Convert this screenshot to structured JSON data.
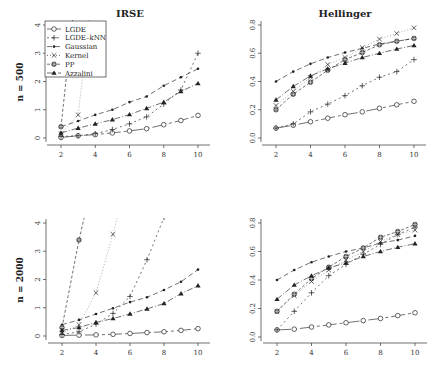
{
  "figure": {
    "column_titles": [
      "IRSE",
      "Hellinger"
    ],
    "row_labels": [
      "n = 500",
      "n = 2000"
    ]
  },
  "legend": {
    "entries": [
      {
        "name": "LGDE",
        "marker": "circle-open",
        "dash": "14,3,3,3"
      },
      {
        "name": "LGDE–kNN",
        "marker": "plus",
        "dash": "2,3"
      },
      {
        "name": "Gaussian",
        "marker": "dot",
        "dash": "5,3"
      },
      {
        "name": "Kernel",
        "marker": "cross",
        "dash": "1,2"
      },
      {
        "name": "PP",
        "marker": "circle-cross",
        "dash": "3,2"
      },
      {
        "name": "Azzalini",
        "marker": "triangle",
        "dash": "6,2,1,2"
      }
    ]
  },
  "chart_data": [
    {
      "type": "line",
      "title": "IRSE",
      "row_label": "n = 500",
      "xlabel": "",
      "ylabel": "n = 500",
      "x": [
        2,
        3,
        4,
        5,
        6,
        7,
        8,
        9,
        10
      ],
      "xlim": [
        2,
        10
      ],
      "ylim": [
        0,
        4
      ],
      "xticks": [
        2,
        4,
        6,
        8,
        10
      ],
      "yticks": [
        0,
        1,
        2,
        3,
        4
      ],
      "legend_position": "top-left",
      "series": [
        {
          "name": "LGDE",
          "values": [
            0.02,
            0.08,
            0.12,
            0.18,
            0.25,
            0.33,
            0.47,
            0.62,
            0.8
          ]
        },
        {
          "name": "LGDE–kNN",
          "values": [
            0.05,
            0.08,
            0.15,
            0.3,
            0.5,
            0.75,
            1.2,
            1.7,
            3.0
          ]
        },
        {
          "name": "Gaussian",
          "values": [
            0.4,
            0.6,
            0.82,
            1.0,
            1.27,
            1.47,
            1.85,
            2.15,
            2.45
          ]
        },
        {
          "name": "Kernel",
          "values": [
            0.15,
            0.82,
            6.0,
            null,
            null,
            null,
            null,
            null,
            null
          ]
        },
        {
          "name": "PP",
          "values": [
            0.4,
            6.0,
            null,
            null,
            null,
            null,
            null,
            null,
            null
          ]
        },
        {
          "name": "Azzalini",
          "values": [
            0.18,
            0.35,
            0.5,
            0.65,
            0.83,
            1.05,
            1.27,
            1.65,
            1.93
          ]
        }
      ]
    },
    {
      "type": "line",
      "title": "Hellinger",
      "row_label": "n = 500",
      "xlabel": "",
      "ylabel": "",
      "x": [
        2,
        3,
        4,
        5,
        6,
        7,
        8,
        9,
        10
      ],
      "xlim": [
        2,
        10
      ],
      "ylim": [
        0,
        0.8
      ],
      "xticks": [
        2,
        4,
        6,
        8,
        10
      ],
      "yticks": [
        0.0,
        0.2,
        0.4,
        0.6,
        0.8
      ],
      "series": [
        {
          "name": "LGDE",
          "values": [
            0.07,
            0.09,
            0.115,
            0.14,
            0.165,
            0.185,
            0.21,
            0.235,
            0.26
          ]
        },
        {
          "name": "LGDE–kNN",
          "values": [
            0.07,
            0.1,
            0.185,
            0.24,
            0.3,
            0.37,
            0.43,
            0.47,
            0.555
          ]
        },
        {
          "name": "Gaussian",
          "values": [
            0.4,
            0.47,
            0.525,
            0.57,
            0.605,
            0.635,
            0.665,
            0.685,
            0.705
          ]
        },
        {
          "name": "Kernel",
          "values": [
            0.23,
            0.33,
            0.43,
            0.52,
            0.57,
            0.64,
            0.7,
            0.74,
            0.78
          ]
        },
        {
          "name": "PP",
          "values": [
            0.2,
            0.31,
            0.395,
            0.48,
            0.555,
            0.605,
            0.66,
            0.685,
            0.705
          ]
        },
        {
          "name": "Azzalini",
          "values": [
            0.27,
            0.365,
            0.44,
            0.49,
            0.53,
            0.57,
            0.6,
            0.63,
            0.655
          ]
        }
      ]
    },
    {
      "type": "line",
      "title": "",
      "row_label": "n = 2000",
      "xlabel": "",
      "ylabel": "n = 2000",
      "x": [
        2,
        3,
        4,
        5,
        6,
        7,
        8,
        9,
        10
      ],
      "xlim": [
        2,
        10
      ],
      "ylim": [
        0,
        4
      ],
      "xticks": [
        2,
        4,
        6,
        8,
        10
      ],
      "yticks": [
        0,
        1,
        2,
        3,
        4
      ],
      "series": [
        {
          "name": "LGDE",
          "values": [
            0.02,
            0.03,
            0.04,
            0.06,
            0.09,
            0.12,
            0.15,
            0.2,
            0.26
          ]
        },
        {
          "name": "LGDE–kNN",
          "values": [
            0.05,
            0.15,
            0.42,
            0.8,
            1.4,
            2.7,
            4.2,
            null,
            null
          ]
        },
        {
          "name": "Gaussian",
          "values": [
            0.4,
            0.57,
            0.78,
            0.98,
            1.2,
            1.37,
            1.63,
            1.92,
            2.35
          ]
        },
        {
          "name": "Kernel",
          "values": [
            0.1,
            0.4,
            1.53,
            3.6,
            6.0,
            null,
            null,
            null,
            null
          ]
        },
        {
          "name": "PP",
          "values": [
            0.3,
            3.4,
            6.0,
            null,
            null,
            null,
            null,
            null,
            null
          ]
        },
        {
          "name": "Azzalini",
          "values": [
            0.2,
            0.3,
            0.48,
            0.62,
            0.78,
            0.96,
            1.15,
            1.5,
            1.78
          ]
        }
      ]
    },
    {
      "type": "line",
      "title": "",
      "row_label": "n = 2000",
      "xlabel": "",
      "ylabel": "",
      "x": [
        2,
        3,
        4,
        5,
        6,
        7,
        8,
        9,
        10
      ],
      "xlim": [
        2,
        10
      ],
      "ylim": [
        0,
        0.8
      ],
      "xticks": [
        2,
        4,
        6,
        8,
        10
      ],
      "yticks": [
        0.0,
        0.2,
        0.4,
        0.6,
        0.8
      ],
      "series": [
        {
          "name": "LGDE",
          "values": [
            0.05,
            0.055,
            0.07,
            0.085,
            0.1,
            0.115,
            0.13,
            0.15,
            0.17
          ]
        },
        {
          "name": "LGDE–kNN",
          "values": [
            0.05,
            0.18,
            0.31,
            0.43,
            0.51,
            0.58,
            0.65,
            0.72,
            0.77
          ]
        },
        {
          "name": "Gaussian",
          "values": [
            0.4,
            0.47,
            0.525,
            0.565,
            0.6,
            0.625,
            0.66,
            0.68,
            0.71
          ]
        },
        {
          "name": "Kernel",
          "values": [
            0.18,
            0.29,
            0.39,
            0.47,
            0.54,
            0.6,
            0.67,
            0.72,
            0.75
          ]
        },
        {
          "name": "PP",
          "values": [
            0.18,
            0.3,
            0.41,
            0.49,
            0.565,
            0.625,
            0.7,
            0.74,
            0.79
          ]
        },
        {
          "name": "Azzalini",
          "values": [
            0.265,
            0.365,
            0.43,
            0.485,
            0.52,
            0.565,
            0.6,
            0.63,
            0.655
          ]
        }
      ]
    }
  ]
}
